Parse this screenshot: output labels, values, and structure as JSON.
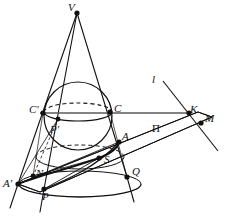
{
  "figure": {
    "type": "geometry-diagram",
    "stroke_color": "#111111",
    "background_color": "#ffffff",
    "width": 231,
    "height": 218
  },
  "labels": [
    {
      "id": "V",
      "text": "V",
      "x": 68,
      "y": 2,
      "style": "italic",
      "describes": "cone-apex"
    },
    {
      "id": "l",
      "text": "l",
      "x": 152,
      "y": 74,
      "style": "italic",
      "describes": "directrix-line"
    },
    {
      "id": "Cp",
      "text": "C'",
      "x": 29,
      "y": 104,
      "style": "italic",
      "describes": "tangent-point-left"
    },
    {
      "id": "C",
      "text": "C",
      "x": 114,
      "y": 103,
      "style": "italic",
      "describes": "tangent-point-right"
    },
    {
      "id": "K",
      "text": "K",
      "x": 190,
      "y": 104,
      "style": "italic",
      "describes": "intersection-point-k"
    },
    {
      "id": "M",
      "text": "M",
      "x": 205,
      "y": 113,
      "style": "italic",
      "describes": "point-m"
    },
    {
      "id": "Pp",
      "text": "P'",
      "x": 50,
      "y": 124,
      "style": "italic",
      "describes": "point-p-prime"
    },
    {
      "id": "A",
      "text": "A",
      "x": 122,
      "y": 131,
      "style": "italic",
      "describes": "vertex-a"
    },
    {
      "id": "Pi",
      "text": "П",
      "x": 152,
      "y": 123,
      "style": "upright",
      "describes": "cutting-plane-pi"
    },
    {
      "id": "S",
      "text": "S",
      "x": 104,
      "y": 154,
      "style": "italic",
      "describes": "focus-s"
    },
    {
      "id": "N",
      "text": "N",
      "x": 36,
      "y": 168,
      "style": "italic",
      "describes": "point-n"
    },
    {
      "id": "Q",
      "text": "Q",
      "x": 132,
      "y": 166,
      "style": "italic",
      "describes": "point-q"
    },
    {
      "id": "Ap",
      "text": "A'",
      "x": 3,
      "y": 178,
      "style": "italic",
      "describes": "vertex-a-prime"
    },
    {
      "id": "P",
      "text": "P",
      "x": 42,
      "y": 191,
      "style": "italic",
      "describes": "point-p"
    }
  ],
  "points": [
    {
      "id": "V",
      "x": 77,
      "y": 13,
      "name": "cone-apex"
    },
    {
      "id": "Cp",
      "x": 43,
      "y": 113,
      "name": "tangent-point-left"
    },
    {
      "id": "C",
      "x": 110,
      "y": 112,
      "name": "tangent-point-right"
    },
    {
      "id": "K",
      "x": 189,
      "y": 113,
      "name": "intersection-point-k"
    },
    {
      "id": "M",
      "x": 201,
      "y": 123,
      "name": "point-m"
    },
    {
      "id": "Pp",
      "x": 58,
      "y": 119,
      "name": "point-p-prime"
    },
    {
      "id": "A",
      "x": 119,
      "y": 142,
      "name": "vertex-a"
    },
    {
      "id": "S",
      "x": 99,
      "y": 158,
      "name": "focus-s"
    },
    {
      "id": "N",
      "x": 33,
      "y": 176,
      "name": "point-n"
    },
    {
      "id": "Q",
      "x": 127,
      "y": 177,
      "name": "point-q"
    },
    {
      "id": "Ap",
      "x": 18,
      "y": 184,
      "name": "vertex-a-prime"
    },
    {
      "id": "P",
      "x": 44,
      "y": 189,
      "name": "point-p"
    }
  ],
  "shapes": {
    "sphere": {
      "cx": 78,
      "cy": 116,
      "r": 34,
      "name": "inscribed-dandelin-sphere"
    },
    "tangent_circle_upper": {
      "cx": 78,
      "cy": 112,
      "rx": 34,
      "ry": 9,
      "name": "sphere-cone-tangent-circle"
    },
    "tangent_circle_lower": {
      "cx": 80,
      "cy": 157,
      "rx": 44,
      "ry": 12,
      "name": "lower-dashed-ellipse"
    },
    "cone_base": {
      "cx": 80,
      "cy": 184,
      "rx": 61,
      "ry": 13,
      "name": "cone-base-ellipse"
    },
    "cutting_plane": {
      "name": "cutting-plane-pi-parallelogram"
    }
  }
}
